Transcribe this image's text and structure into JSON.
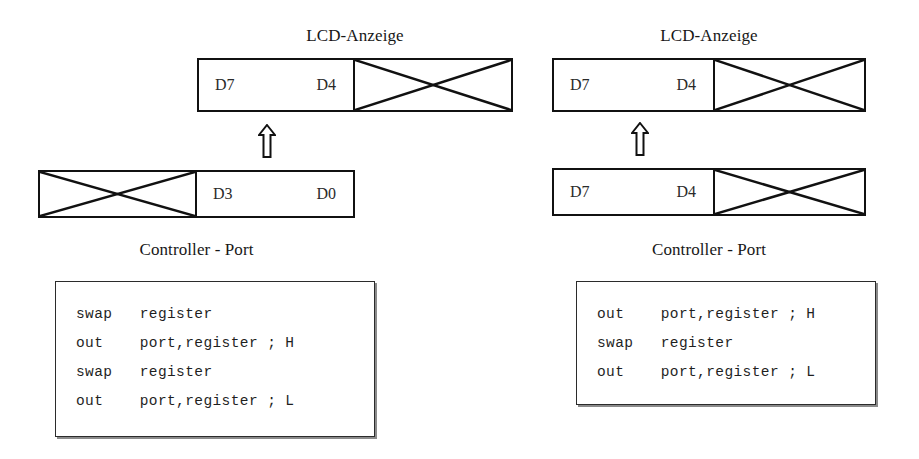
{
  "diagram": {
    "title_left": "LCD-Anzeige",
    "title_right": "LCD-Anzeige",
    "port_label_left": "Controller - Port",
    "port_label_right": "Controller - Port"
  },
  "left": {
    "lcd_caption": "LCD-Anzeige",
    "lcd_box": {
      "left_half": {
        "bit_high": "D7",
        "bit_low": "D4",
        "crossed": false
      },
      "right_half": {
        "bit_high": "",
        "bit_low": "",
        "crossed": true
      }
    },
    "arrow": "up-arrow-icon",
    "port_box": {
      "left_half": {
        "bit_high": "",
        "bit_low": "",
        "crossed": true
      },
      "right_half": {
        "bit_high": "D3",
        "bit_low": "D0",
        "crossed": false
      }
    },
    "port_caption": "Controller - Port",
    "code": [
      "swap   register",
      "out    port,register ; H",
      "swap   register",
      "out    port,register ; L"
    ]
  },
  "right": {
    "lcd_caption": "LCD-Anzeige",
    "lcd_box": {
      "left_half": {
        "bit_high": "D7",
        "bit_low": "D4",
        "crossed": false
      },
      "right_half": {
        "bit_high": "",
        "bit_low": "",
        "crossed": true
      }
    },
    "arrow": "up-arrow-icon",
    "port_box": {
      "left_half": {
        "bit_high": "D7",
        "bit_low": "D4",
        "crossed": false
      },
      "right_half": {
        "bit_high": "",
        "bit_low": "",
        "crossed": true
      }
    },
    "port_caption": "Controller - Port",
    "code": [
      "out    port,register ; H",
      "swap   register",
      "out    port,register ; L"
    ]
  },
  "colors": {
    "stroke": "#111111",
    "text": "#1a1a1a",
    "code_border": "#2b2b2b",
    "code_shadow": "#8a8a8a",
    "background": "#ffffff"
  }
}
